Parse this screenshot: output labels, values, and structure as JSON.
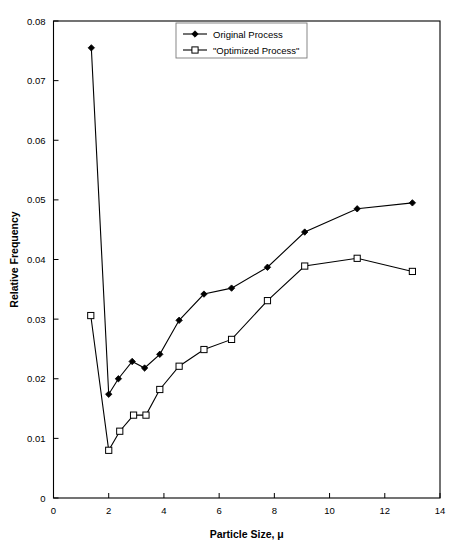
{
  "chart_data": {
    "type": "line",
    "title": "",
    "xlabel": "Particle Size, μ",
    "ylabel": "Relative Frequency",
    "xlim": [
      0,
      14
    ],
    "ylim": [
      0,
      0.08
    ],
    "xticks": [
      "0",
      "2",
      "4",
      "6",
      "8",
      "10",
      "12",
      "14"
    ],
    "xtick_values": [
      0,
      2,
      4,
      6,
      8,
      10,
      12,
      14
    ],
    "yticks": [
      "0",
      "0.01",
      "0.02",
      "0.03",
      "0.04",
      "0.05",
      "0.06",
      "0.07",
      "0.08"
    ],
    "ytick_values": [
      0,
      0.01,
      0.02,
      0.03,
      0.04,
      0.05,
      0.06,
      0.07,
      0.08
    ],
    "grid": false,
    "legend_position": "top-center",
    "series": [
      {
        "name": "Original Process",
        "marker": "filled-diamond",
        "x": [
          1.37,
          2.0,
          2.35,
          2.85,
          3.3,
          3.85,
          4.55,
          5.45,
          6.45,
          7.75,
          9.1,
          11.0,
          13.0
        ],
        "y": [
          0.0755,
          0.0174,
          0.02,
          0.0229,
          0.0218,
          0.0241,
          0.0298,
          0.0342,
          0.0352,
          0.0387,
          0.0446,
          0.0485,
          0.0495
        ]
      },
      {
        "name": "\"Optimized Process\"",
        "marker": "open-square",
        "x": [
          1.35,
          2.0,
          2.4,
          2.9,
          3.35,
          3.85,
          4.55,
          5.45,
          6.45,
          7.75,
          9.1,
          11.0,
          13.0
        ],
        "y": [
          0.0306,
          0.008,
          0.0112,
          0.0139,
          0.0139,
          0.0182,
          0.0221,
          0.0249,
          0.0266,
          0.0331,
          0.0389,
          0.0402,
          0.038
        ]
      }
    ]
  },
  "legend": {
    "entries": [
      {
        "label": "Original Process"
      },
      {
        "label": "\"Optimized Process\""
      }
    ]
  },
  "axes": {
    "x_title": "Particle Size, μ",
    "y_title": "Relative Frequency"
  },
  "colors": {
    "line": "#000000",
    "background": "#ffffff",
    "frame": "#000000",
    "legend_border": "#7a7a7a"
  }
}
